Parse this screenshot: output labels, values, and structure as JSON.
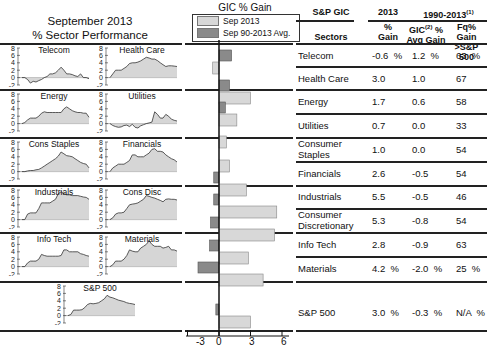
{
  "left_panel": {
    "title_line1": "September 2013",
    "title_line2": "% Sector Performance",
    "y_ticks": [
      "8",
      "6",
      "4",
      "2",
      "0",
      "-2"
    ],
    "mini_charts": [
      {
        "name": "Telecom",
        "series": [
          0,
          0,
          -0.5,
          -1.5,
          -1,
          -1.2,
          -0.8,
          -0.5,
          0,
          0.3,
          1,
          1,
          1.3,
          2,
          2.8,
          2,
          1,
          1,
          0.8,
          0.5,
          0.3,
          1,
          0,
          0,
          -0.3
        ]
      },
      {
        "name": "Health Care",
        "series": [
          0,
          1,
          2,
          2,
          2,
          2.5,
          3,
          3.8,
          4,
          4,
          4.2,
          4.5,
          5,
          5.5,
          5.3,
          5,
          5,
          4.6,
          4,
          3.5,
          3,
          3.2,
          3.2,
          3.1,
          3
        ]
      },
      {
        "name": "Energy",
        "series": [
          0,
          0.3,
          1,
          1.5,
          1.5,
          1.5,
          2,
          2.8,
          3.2,
          3,
          3,
          3,
          3,
          3,
          3,
          4,
          4.5,
          4,
          3.5,
          3.2,
          3,
          3,
          2.8,
          2.8,
          1.7
        ]
      },
      {
        "name": "Utilities",
        "series": [
          0,
          -0.5,
          -0.8,
          -1,
          -0.9,
          -0.5,
          -0.4,
          -0.8,
          -0.2,
          -1,
          -1.2,
          -0.6,
          -0.3,
          0,
          0.2,
          0.4,
          3.2,
          2.5,
          1.5,
          1.5,
          2.5,
          2,
          1.2,
          0.9,
          0.7
        ]
      },
      {
        "name": "Cons Staples",
        "series": [
          0,
          0,
          0.2,
          0.3,
          0.3,
          0.5,
          0.6,
          1,
          1.5,
          2,
          2.5,
          3,
          3.5,
          4.2,
          5.3,
          4.8,
          4.3,
          4.2,
          4,
          3.5,
          3,
          2.5,
          2.2,
          2,
          1
        ]
      },
      {
        "name": "Financials",
        "series": [
          0,
          1,
          1.5,
          2,
          2,
          2,
          2.5,
          3,
          4.5,
          4.5,
          4,
          4,
          4,
          4.5,
          5,
          6,
          6.2,
          5.5,
          5.5,
          5.3,
          4.5,
          4,
          3.5,
          3.2,
          2.6
        ]
      },
      {
        "name": "Industrials",
        "series": [
          0,
          0,
          1.5,
          1.8,
          1.8,
          1.8,
          3,
          4.5,
          4.5,
          4.5,
          4.5,
          5,
          5.5,
          7,
          7.5,
          7,
          6.7,
          6.7,
          6.5,
          6.5,
          6.5,
          6.3,
          6.1,
          6,
          5.5
        ]
      },
      {
        "name": "Cons Disc",
        "series": [
          0,
          0.5,
          1.5,
          1.8,
          1.8,
          2,
          3,
          4,
          4.2,
          4.3,
          4.5,
          5,
          5.5,
          6.5,
          6.3,
          6,
          5.8,
          5.5,
          5.2,
          4.8,
          5.5,
          5.6,
          5.5,
          5.5,
          5.3
        ]
      },
      {
        "name": "Info Tech",
        "series": [
          0,
          0,
          1,
          1.5,
          1.5,
          1.5,
          2,
          3.3,
          3,
          2.8,
          2.8,
          2.8,
          2.8,
          2.8,
          3,
          4.5,
          4.5,
          4,
          4,
          4,
          4,
          3.5,
          3.3,
          3,
          2.8
        ]
      },
      {
        "name": "Materials",
        "series": [
          0,
          0.5,
          1.5,
          1.5,
          1.5,
          2,
          3,
          4.5,
          4.2,
          4,
          4,
          5,
          5.5,
          6,
          7,
          6,
          5.5,
          5.5,
          5.5,
          5,
          5.2,
          5.5,
          4.5,
          4.5,
          4.2
        ]
      },
      {
        "name": "S&P 500",
        "series": [
          0,
          0.3,
          1.5,
          1.5,
          1.5,
          1.6,
          2.2,
          3,
          3.3,
          3.2,
          3.3,
          3.5,
          4,
          4.5,
          5.5,
          5,
          4.8,
          4.5,
          4.2,
          4,
          3.8,
          3.5,
          3.3,
          3.2,
          3
        ]
      }
    ]
  },
  "bar_chart": {
    "title": "GIC % Gain",
    "legend": [
      {
        "label": "Sep 2013",
        "color": "#d8d8d8"
      },
      {
        "label": "Sep 90-2013 Avg.",
        "color": "#8a8a8a"
      }
    ],
    "x_ticks": [
      "-3",
      "0",
      "3",
      "6"
    ]
  },
  "chart_data": {
    "type": "bar",
    "title": "GIC % Gain",
    "orientation": "horizontal",
    "categories": [
      "Telecom",
      "Health Care",
      "Energy",
      "Utilities",
      "Consumer Staples",
      "Financials",
      "Industrials",
      "Consumer Discretionary",
      "Info Tech",
      "Materials",
      "S&P 500"
    ],
    "series": [
      {
        "name": "Sep 2013",
        "values": [
          -0.6,
          3.0,
          1.7,
          0.7,
          1.0,
          2.6,
          5.5,
          5.3,
          2.8,
          4.2,
          3.0
        ]
      },
      {
        "name": "Sep 90-2013 Avg.",
        "values": [
          1.2,
          1.0,
          0.6,
          0.0,
          0.0,
          -0.5,
          -0.5,
          -0.8,
          -0.9,
          -2.0,
          -0.3
        ]
      }
    ],
    "xlim": [
      -3,
      6
    ],
    "xlabel": "",
    "ylabel": "",
    "legend_position": "top"
  },
  "table": {
    "header_top": {
      "col1": "S&P GIC",
      "col2": "2013",
      "col3": "1990-2013",
      "col3_sup": "(1)"
    },
    "header_sub": {
      "sectors": "Sectors",
      "gain_line1": "%",
      "gain_line2": "Gain",
      "avg_line1": "GIC",
      "avg_sup": "(2)",
      "avg_line1b": " %",
      "avg_line2": "Avg Gain",
      "fq_line1": "Fq% Gain",
      "fq_line2": ">S&P 500"
    },
    "rows": [
      {
        "sector": "Telecom",
        "sector2": "",
        "gain": "-0.6  %",
        "avg": "1.2  %",
        "fq": "63  %"
      },
      {
        "sector": "Health Care",
        "sector2": "",
        "gain": "3.0",
        "avg": "1.0",
        "fq": "67"
      },
      {
        "sector": "Energy",
        "sector2": "",
        "gain": "1.7",
        "avg": "0.6",
        "fq": "58"
      },
      {
        "sector": "Utilities",
        "sector2": "",
        "gain": "0.7",
        "avg": "0.0",
        "fq": "33"
      },
      {
        "sector": "Consumer",
        "sector2": "Staples",
        "gain": "1.0",
        "avg": "0.0",
        "fq": "54"
      },
      {
        "sector": "Financials",
        "sector2": "",
        "gain": "2.6",
        "avg": "-0.5",
        "fq": "54"
      },
      {
        "sector": "Industrials",
        "sector2": "",
        "gain": "5.5",
        "avg": "-0.5",
        "fq": "46"
      },
      {
        "sector": "Consumer",
        "sector2": "Discretionary",
        "gain": "5.3",
        "avg": "-0.8",
        "fq": "54"
      },
      {
        "sector": "Info Tech",
        "sector2": "",
        "gain": "2.8",
        "avg": "-0.9",
        "fq": "63"
      },
      {
        "sector": "Materials",
        "sector2": "",
        "gain": "4.2  %",
        "avg": "-2.0  %",
        "fq": "25  %"
      },
      {
        "sector": "S&P 500",
        "sector2": "",
        "gain": "3.0  %",
        "avg": "-0.3  %",
        "fq": "N/A  %"
      }
    ]
  }
}
